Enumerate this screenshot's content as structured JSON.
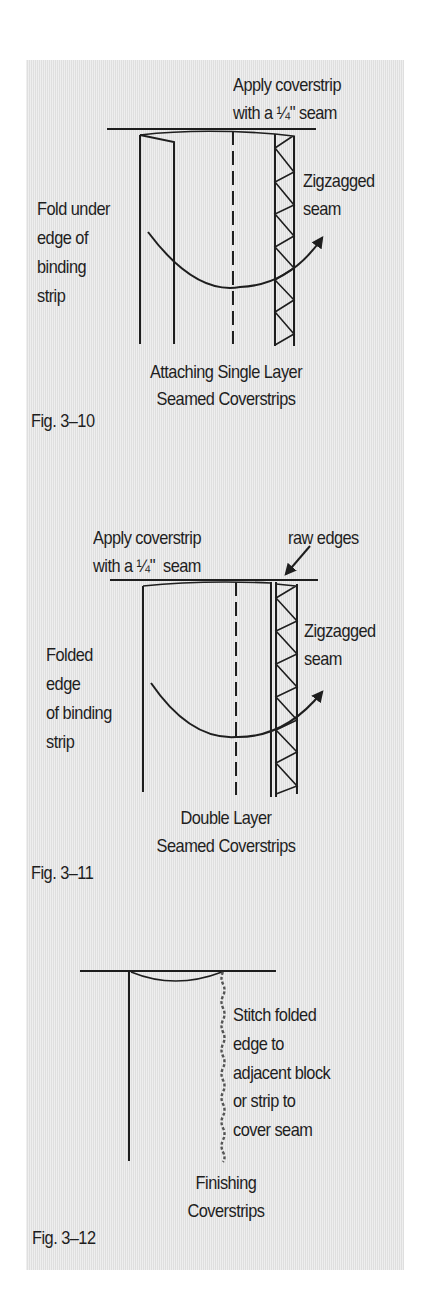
{
  "figures": [
    {
      "id": "fig-3-10",
      "number": "Fig. 3–10",
      "caption": [
        "Attaching Single Layer",
        "Seamed Coverstrips"
      ],
      "labels": {
        "top": [
          "Apply coverstrip",
          "with a ¼\" seam"
        ],
        "left": [
          "Fold under",
          "edge of",
          "binding",
          "strip"
        ],
        "right": [
          "Zigzagged",
          "seam"
        ]
      }
    },
    {
      "id": "fig-3-11",
      "number": "Fig. 3–11",
      "caption": [
        "Double Layer",
        "Seamed Coverstrips"
      ],
      "labels": {
        "top": [
          "Apply coverstrip",
          "with a ¼\"  seam"
        ],
        "top_right": "raw edges",
        "left": [
          "Folded",
          "edge",
          "of binding",
          "strip"
        ],
        "right": [
          "Zigzagged",
          "seam"
        ]
      }
    },
    {
      "id": "fig-3-12",
      "number": "Fig. 3–12",
      "caption": [
        "Finishing",
        "Coverstrips"
      ],
      "labels": {
        "right": [
          "Stitch folded",
          "edge to",
          "adjacent block",
          "or strip to",
          "cover seam"
        ]
      }
    }
  ],
  "colors": {
    "panel": "#e6e6e6",
    "ink": "#1e1e1e",
    "stitch": "#555555"
  }
}
